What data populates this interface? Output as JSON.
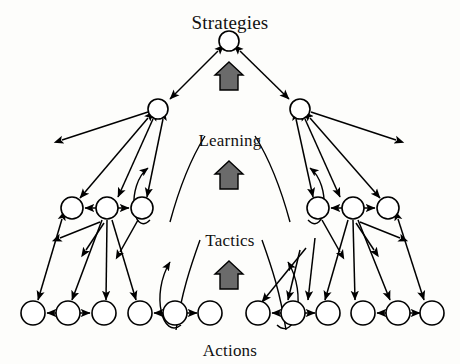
{
  "diagram": {
    "type": "hierarchical-node-diagram",
    "background_color": "#fdfdfb",
    "stroke_color": "#000000",
    "node_fill": "#ffffff",
    "block_arrow_fill": "#6b6b6b",
    "block_arrow_stroke": "#000000",
    "labels": {
      "strategies": "Strategies",
      "learning": "Learning",
      "tactics": "Tactics",
      "actions": "Actions"
    },
    "levels": [
      {
        "name": "strategies",
        "label": "Strategies",
        "node_count": 1,
        "nodes": [
          {
            "id": "s1",
            "cx": 229,
            "cy": 41,
            "r": 10
          }
        ]
      },
      {
        "name": "tactics-upper",
        "label": "",
        "node_count": 2,
        "nodes": [
          {
            "id": "t1",
            "cx": 158,
            "cy": 109,
            "r": 10
          },
          {
            "id": "t2",
            "cx": 300,
            "cy": 109,
            "r": 10
          }
        ]
      },
      {
        "name": "tactics-lower",
        "label": "",
        "node_count": 6,
        "nodes": [
          {
            "id": "m1",
            "cx": 72,
            "cy": 208,
            "r": 11
          },
          {
            "id": "m2",
            "cx": 107,
            "cy": 208,
            "r": 11
          },
          {
            "id": "m3",
            "cx": 142,
            "cy": 208,
            "r": 11
          },
          {
            "id": "m4",
            "cx": 318,
            "cy": 208,
            "r": 11
          },
          {
            "id": "m5",
            "cx": 353,
            "cy": 208,
            "r": 11
          },
          {
            "id": "m6",
            "cx": 388,
            "cy": 208,
            "r": 11
          }
        ]
      },
      {
        "name": "actions",
        "label": "Actions",
        "node_count": 12,
        "nodes": [
          {
            "id": "a1",
            "cx": 33,
            "cy": 313,
            "r": 12
          },
          {
            "id": "a2",
            "cx": 68,
            "cy": 313,
            "r": 12
          },
          {
            "id": "a3",
            "cx": 104,
            "cy": 313,
            "r": 12
          },
          {
            "id": "a4",
            "cx": 140,
            "cy": 313,
            "r": 12
          },
          {
            "id": "a5",
            "cx": 175,
            "cy": 313,
            "r": 12
          },
          {
            "id": "a6",
            "cx": 210,
            "cy": 313,
            "r": 12
          },
          {
            "id": "a7",
            "cx": 258,
            "cy": 313,
            "r": 12
          },
          {
            "id": "a8",
            "cx": 293,
            "cy": 313,
            "r": 12
          },
          {
            "id": "a9",
            "cx": 328,
            "cy": 313,
            "r": 12
          },
          {
            "id": "a10",
            "cx": 363,
            "cy": 313,
            "r": 12
          },
          {
            "id": "a11",
            "cx": 398,
            "cy": 313,
            "r": 12
          },
          {
            "id": "a12",
            "cx": 432,
            "cy": 313,
            "r": 12
          }
        ]
      }
    ],
    "block_arrows": [
      {
        "id": "up-arrow-strategies",
        "cx": 229,
        "cy": 78,
        "direction": "up"
      },
      {
        "id": "up-arrow-learning",
        "cx": 229,
        "cy": 175,
        "direction": "up"
      },
      {
        "id": "up-arrow-tactics",
        "cx": 229,
        "cy": 275,
        "direction": "up"
      }
    ]
  }
}
